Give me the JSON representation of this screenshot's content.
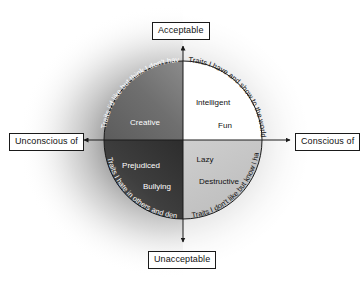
{
  "diagram": {
    "type": "quadrant-circle",
    "title_visible": false,
    "axes": {
      "top_label": "Acceptable",
      "bottom_label": "Unacceptable",
      "left_label": "Unconscious of",
      "right_label": "Conscious of"
    },
    "quadrants": [
      {
        "id": "upper-left",
        "position": "upper-left",
        "fill_color": "#6d6d6d",
        "text_color": "#ffffff",
        "traits": [
          "Creative"
        ],
        "arc_label": "Traits I'd like but think I don't have"
      },
      {
        "id": "upper-right",
        "position": "upper-right",
        "fill_color": "#ffffff",
        "text_color": "#111111",
        "traits": [
          "Intelligent",
          "Fun"
        ],
        "arc_label": "Traits I have and show to the world"
      },
      {
        "id": "lower-left",
        "position": "lower-left",
        "fill_color": "#3a3a3a",
        "text_color": "#ffffff",
        "traits": [
          "Prejudiced",
          "Bullying"
        ],
        "arc_label": "Traits I hate in others and deny I have"
      },
      {
        "id": "lower-right",
        "position": "lower-right",
        "fill_color": "#c9c9c9",
        "text_color": "#111111",
        "traits": [
          "Lazy",
          "Destructive"
        ],
        "arc_label": "Traits I don't like but know I have"
      }
    ],
    "traits": {
      "creative": "Creative",
      "intelligent": "Intelligent",
      "fun": "Fun",
      "prejudiced": "Prejudiced",
      "bullying": "Bullying",
      "lazy": "Lazy",
      "destructive": "Destructive"
    },
    "arc_labels": {
      "upper_right": "Traits I have and show to the world",
      "upper_left": "Traits I'd like but think I don't have",
      "lower_left": "Traits I hate in others and deny I have",
      "lower_right": "Traits I don't like but know I have"
    },
    "colors": {
      "outline": "#1a1a1a",
      "axis": "#1a1a1a",
      "background_glow": "#8a8a8a",
      "page_background": "#ffffff",
      "quadrant_upper_left": "#6d6d6d",
      "quadrant_upper_right": "#ffffff",
      "quadrant_lower_left": "#3a3a3a",
      "quadrant_lower_right": "#c9c9c9"
    }
  }
}
